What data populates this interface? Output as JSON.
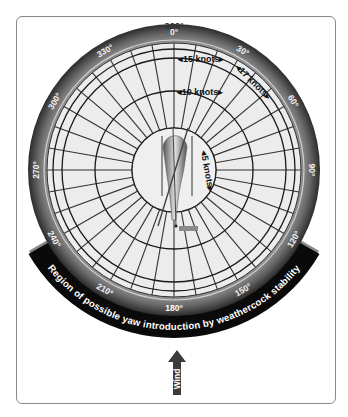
{
  "diagram": {
    "title_degree": "360°",
    "compass_labels": [
      {
        "angle": 0,
        "text": "0°"
      },
      {
        "angle": 30,
        "text": "30°"
      },
      {
        "angle": 60,
        "text": "60°"
      },
      {
        "angle": 90,
        "text": "90°"
      },
      {
        "angle": 120,
        "text": "120°"
      },
      {
        "angle": 150,
        "text": "150°"
      },
      {
        "angle": 180,
        "text": "180°"
      },
      {
        "angle": 210,
        "text": "210°"
      },
      {
        "angle": 240,
        "text": "240°"
      },
      {
        "angle": 270,
        "text": "270°"
      },
      {
        "angle": 300,
        "text": "300°"
      },
      {
        "angle": 330,
        "text": "330°"
      }
    ],
    "speed_rings": [
      {
        "knots": 5,
        "label": "5 knots"
      },
      {
        "knots": 10,
        "label": "10 knots"
      },
      {
        "knots": 15,
        "label": "15 knots"
      },
      {
        "knots": 17,
        "label": "17 knots"
      }
    ],
    "region_label": "Region of possible yaw introduction by weathercock stability",
    "region_range_deg": [
      120,
      240
    ],
    "wind_label": "Wind",
    "colors": {
      "ring_dark": "#3a3a3a",
      "ring_light": "#8c8c8c",
      "disk": "#ececec",
      "region_band": "#0a0a0a",
      "wind_arrow": "#3c3c3c"
    }
  }
}
